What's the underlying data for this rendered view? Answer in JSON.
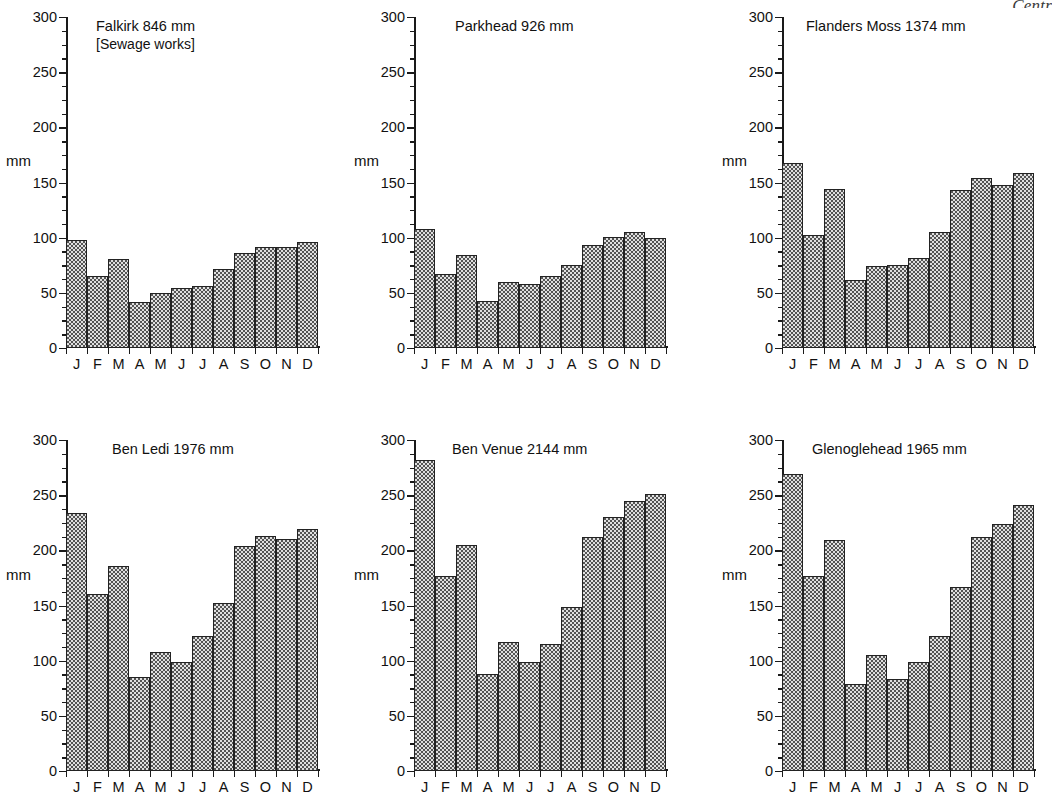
{
  "page": {
    "corner_note": "Centr"
  },
  "axis": {
    "unit_label": "mm",
    "y_ticks": [
      0,
      50,
      100,
      150,
      200,
      250,
      300
    ],
    "y_min": 0,
    "y_max": 300,
    "months": [
      "J",
      "F",
      "M",
      "A",
      "M",
      "J",
      "J",
      "A",
      "S",
      "O",
      "N",
      "D"
    ]
  },
  "chart_data": [
    {
      "type": "bar",
      "title": "Falkirk  846 mm",
      "subtitle": "[Sewage works]",
      "station": "Falkirk",
      "annual_total_mm": 846,
      "xlabel": "",
      "ylabel": "mm",
      "ylim": [
        0,
        300
      ],
      "grid": false,
      "categories": [
        "J",
        "F",
        "M",
        "A",
        "M",
        "J",
        "J",
        "A",
        "S",
        "O",
        "N",
        "D"
      ],
      "values": [
        98,
        65,
        81,
        42,
        50,
        54,
        56,
        72,
        86,
        92,
        92,
        96
      ]
    },
    {
      "type": "bar",
      "title": "Parkhead   926 mm",
      "subtitle": "",
      "station": "Parkhead",
      "annual_total_mm": 926,
      "xlabel": "",
      "ylabel": "mm",
      "ylim": [
        0,
        300
      ],
      "grid": false,
      "categories": [
        "J",
        "F",
        "M",
        "A",
        "M",
        "J",
        "J",
        "A",
        "S",
        "O",
        "N",
        "D"
      ],
      "values": [
        108,
        67,
        84,
        43,
        60,
        58,
        65,
        75,
        93,
        101,
        105,
        100
      ]
    },
    {
      "type": "bar",
      "title": "Flanders Moss 1374 mm",
      "subtitle": "",
      "station": "Flanders Moss",
      "annual_total_mm": 1374,
      "xlabel": "",
      "ylabel": "mm",
      "ylim": [
        0,
        300
      ],
      "grid": false,
      "categories": [
        "J",
        "F",
        "M",
        "A",
        "M",
        "J",
        "J",
        "A",
        "S",
        "O",
        "N",
        "D"
      ],
      "values": [
        168,
        102,
        144,
        62,
        74,
        75,
        82,
        105,
        143,
        154,
        148,
        159
      ]
    },
    {
      "type": "bar",
      "title": "Ben Ledi  1976 mm",
      "subtitle": "",
      "station": "Ben Ledi",
      "annual_total_mm": 1976,
      "xlabel": "",
      "ylabel": "mm",
      "ylim": [
        0,
        300
      ],
      "grid": false,
      "categories": [
        "J",
        "F",
        "M",
        "A",
        "M",
        "J",
        "J",
        "A",
        "S",
        "O",
        "N",
        "D"
      ],
      "values": [
        234,
        160,
        186,
        85,
        108,
        99,
        122,
        152,
        204,
        213,
        210,
        219
      ]
    },
    {
      "type": "bar",
      "title": "Ben Venue   2144 mm",
      "subtitle": "",
      "station": "Ben Venue",
      "annual_total_mm": 2144,
      "xlabel": "",
      "ylabel": "mm",
      "ylim": [
        0,
        300
      ],
      "grid": false,
      "categories": [
        "J",
        "F",
        "M",
        "A",
        "M",
        "J",
        "J",
        "A",
        "S",
        "O",
        "N",
        "D"
      ],
      "values": [
        282,
        177,
        205,
        88,
        117,
        99,
        115,
        149,
        212,
        230,
        245,
        251
      ]
    },
    {
      "type": "bar",
      "title": "Glenoglehead  1965 mm",
      "subtitle": "",
      "station": "Glenoglehead",
      "annual_total_mm": 1965,
      "xlabel": "",
      "ylabel": "mm",
      "ylim": [
        0,
        300
      ],
      "grid": false,
      "categories": [
        "J",
        "F",
        "M",
        "A",
        "M",
        "J",
        "J",
        "A",
        "S",
        "O",
        "N",
        "D"
      ],
      "values": [
        269,
        177,
        209,
        79,
        105,
        83,
        99,
        122,
        167,
        212,
        224,
        241
      ]
    }
  ]
}
